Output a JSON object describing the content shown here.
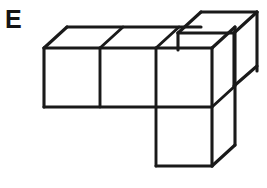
{
  "figure": {
    "label": "E",
    "background_color": "#ffffff",
    "line_color": "#1a1a1a",
    "face_color": "#ffffff",
    "label_color": "#141414",
    "cube_count_visible": 5,
    "projection": {
      "type": "oblique",
      "cube_width": 56,
      "cube_height": 59,
      "depth_dx": 23,
      "depth_dy": -21
    },
    "parts": [
      {
        "name": "front-row-cube-left",
        "position": "row front, column 1"
      },
      {
        "name": "front-row-cube-middle",
        "position": "row front, column 2"
      },
      {
        "name": "front-row-cube-right",
        "position": "row front, column 3"
      },
      {
        "name": "top-cube",
        "position": "stacked above column 3, back layer"
      },
      {
        "name": "bottom-cube",
        "position": "below column 3, front layer"
      }
    ]
  }
}
